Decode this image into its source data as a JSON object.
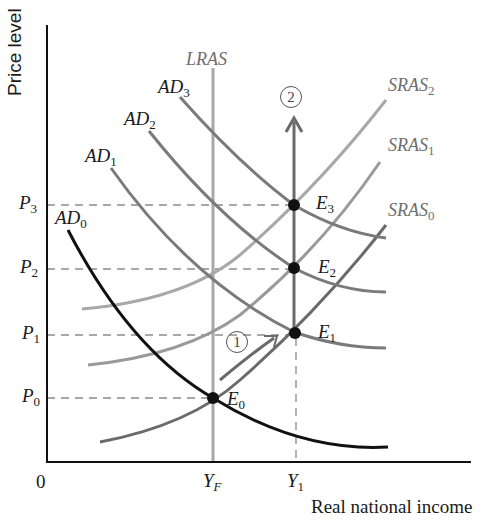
{
  "axes": {
    "y_label": "Price level",
    "x_label": "Real national income",
    "origin": "0"
  },
  "price_levels": [
    {
      "name": "P",
      "sub": "0"
    },
    {
      "name": "P",
      "sub": "1"
    },
    {
      "name": "P",
      "sub": "2"
    },
    {
      "name": "P",
      "sub": "3"
    }
  ],
  "income_levels": [
    {
      "name": "Y",
      "sub": "F"
    },
    {
      "name": "Y",
      "sub": "1"
    }
  ],
  "curves": {
    "lras": "LRAS",
    "ad": [
      {
        "name": "AD",
        "sub": "0"
      },
      {
        "name": "AD",
        "sub": "1"
      },
      {
        "name": "AD",
        "sub": "2"
      },
      {
        "name": "AD",
        "sub": "3"
      }
    ],
    "sras": [
      {
        "name": "SRAS",
        "sub": "0"
      },
      {
        "name": "SRAS",
        "sub": "1"
      },
      {
        "name": "SRAS",
        "sub": "2"
      }
    ]
  },
  "equilibria": [
    {
      "name": "E",
      "sub": "0"
    },
    {
      "name": "E",
      "sub": "1"
    },
    {
      "name": "E",
      "sub": "2"
    },
    {
      "name": "E",
      "sub": "3"
    }
  ],
  "steps": [
    "1",
    "2"
  ],
  "colors": {
    "axis": "#111111",
    "ad0": "#111111",
    "ad_shifted": "#7a7a7a",
    "lras": "#a8a8a8",
    "sras0": "#6a6a6a",
    "sras1": "#9a9a9a",
    "sras2": "#a8a8a8",
    "arrow": "#6a6a6a",
    "dashed": "#8a8a8a",
    "point": "#111111"
  }
}
